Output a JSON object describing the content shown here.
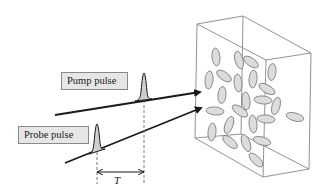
{
  "labels": {
    "pump": "Pump pulse",
    "probe": "Probe pulse",
    "delay": "T"
  },
  "colors": {
    "line": "#1a1a1a",
    "box_edge": "#777777",
    "ellipse_fill": "#dcdcdc",
    "ellipse_stroke": "#777777",
    "label_bg": "#e6e6e6",
    "pulse_fill": "#cfcfcf"
  },
  "beams": [
    {
      "name": "pump",
      "from": [
        55,
        115
      ],
      "to": [
        201,
        92
      ]
    },
    {
      "name": "probe",
      "from": [
        65,
        163
      ],
      "to": [
        202,
        107
      ]
    }
  ],
  "pulses": [
    {
      "name": "pump",
      "peak_x": 144,
      "peak_y": 73,
      "base_y": 100
    },
    {
      "name": "probe",
      "peak_x": 97,
      "peak_y": 124,
      "base_y": 152
    }
  ],
  "sample_box": {
    "front": [
      [
        197,
        24
      ],
      [
        266,
        60
      ],
      [
        263,
        177
      ],
      [
        195,
        138
      ]
    ],
    "back": [
      [
        243,
        16
      ],
      [
        311,
        53
      ],
      [
        309,
        169
      ],
      [
        241,
        134
      ]
    ]
  }
}
